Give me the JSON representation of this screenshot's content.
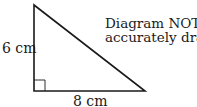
{
  "diagram": {
    "shape": "right-triangle",
    "vertices": {
      "top": [
        34,
        5
      ],
      "right_angle": [
        34,
        91
      ],
      "right": [
        145,
        91
      ]
    },
    "labels": {
      "vertical_side": "6 cm",
      "horizontal_side": "8 cm"
    },
    "note": {
      "line1": "Diagram NOT",
      "line2": "accurately drawn"
    },
    "right_angle_marker": true,
    "stroke_color": "#1a1a1a"
  }
}
